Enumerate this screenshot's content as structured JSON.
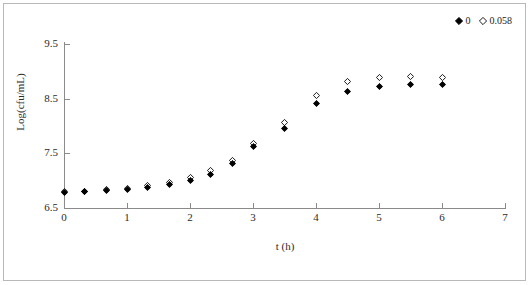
{
  "chart_data": {
    "type": "scatter",
    "title": "",
    "xlabel": "t (h)",
    "ylabel": "Log(cfu/mL)",
    "xlim": [
      0,
      7
    ],
    "ylim": [
      6.5,
      9.5
    ],
    "xticks": [
      0,
      1,
      2,
      3,
      4,
      5,
      6,
      7
    ],
    "yticks": [
      6.5,
      7.5,
      8.5,
      9.5
    ],
    "xtick_labels": [
      "0",
      "1",
      "2",
      "3",
      "4",
      "5",
      "6",
      "7"
    ],
    "ytick_labels": [
      "6.5",
      "7.5",
      "8.5",
      "9.5"
    ],
    "grid": false,
    "legend_position": "top-right",
    "series": [
      {
        "name": "0",
        "marker": "filled-diamond",
        "color": "#000000",
        "x": [
          0,
          0.33,
          0.67,
          1.0,
          1.33,
          1.67,
          2.0,
          2.33,
          2.67,
          3.0,
          3.5,
          4.0,
          4.5,
          5.0,
          5.5,
          6.0
        ],
        "y": [
          6.79,
          6.8,
          6.82,
          6.84,
          6.88,
          6.93,
          7.0,
          7.12,
          7.31,
          7.62,
          7.95,
          8.42,
          8.64,
          8.72,
          8.76,
          8.76
        ]
      },
      {
        "name": "0.058",
        "marker": "open-diamond",
        "color": "#000000",
        "x": [
          0,
          0.33,
          0.67,
          1.0,
          1.33,
          1.67,
          2.0,
          2.33,
          2.67,
          3.0,
          3.5,
          4.0,
          4.5,
          5.0,
          5.5,
          6.0
        ],
        "y": [
          6.8,
          6.81,
          6.83,
          6.86,
          6.91,
          6.97,
          7.05,
          7.18,
          7.37,
          7.68,
          8.06,
          8.55,
          8.82,
          8.88,
          8.9,
          8.88
        ]
      }
    ]
  },
  "legend": {
    "entries": [
      {
        "label": "0",
        "marker": "filled-diamond"
      },
      {
        "label": "0.058",
        "marker": "open-diamond"
      }
    ]
  }
}
